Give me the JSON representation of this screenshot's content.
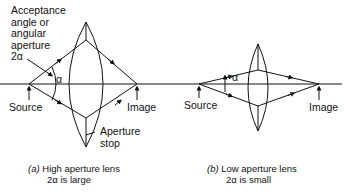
{
  "diagram": {
    "panel_a": {
      "acceptance_label": [
        "Acceptance",
        "angle or",
        "angular",
        "aperture",
        "2α"
      ],
      "alpha_label": "α",
      "source_label": "Source",
      "image_label": "Image",
      "aperture_stop_label": [
        "Aperture",
        "stop"
      ],
      "caption_letter": "(a)",
      "caption_line1": "High aperture lens",
      "caption_line2": "2α is large"
    },
    "panel_b": {
      "alpha_label": "α",
      "source_label": "Source",
      "image_label": "Image",
      "caption_letter": "(b)",
      "caption_line1": "Low aperture lens",
      "caption_line2": "2α is small"
    },
    "line_color": "#111111"
  }
}
